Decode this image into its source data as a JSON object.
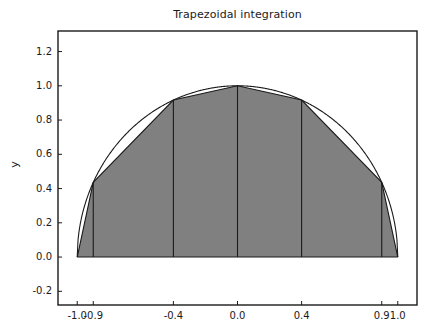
{
  "chart_data": {
    "type": "area",
    "title": "Trapezoidal integration",
    "xlabel": "",
    "ylabel": "y",
    "xlim": [
      -1.12,
      1.12
    ],
    "ylim": [
      -0.28,
      1.32
    ],
    "grid": false,
    "legend": null,
    "xticks": [
      -1.0,
      -0.9,
      -0.4,
      0.0,
      0.4,
      0.9,
      1.0
    ],
    "xtick_labels": [
      "-1.0",
      "-0.9",
      "-0.4",
      "0.0",
      "0.4",
      "0.9",
      "1.0"
    ],
    "yticks": [
      -0.2,
      0.0,
      0.2,
      0.4,
      0.6,
      0.8,
      1.0,
      1.2
    ],
    "ytick_labels": [
      "-0.2",
      "0.0",
      "0.2",
      "0.4",
      "0.6",
      "0.8",
      "1.0",
      "1.2"
    ],
    "curve": {
      "name": "f(x) = sqrt(1 - x^2)",
      "description": "smooth semicircle curve drawn as thin black outline",
      "color": "#1a1a1a",
      "x": [
        -1.0,
        -0.95,
        -0.9,
        -0.8,
        -0.7,
        -0.6,
        -0.5,
        -0.4,
        -0.3,
        -0.2,
        -0.1,
        0.0,
        0.1,
        0.2,
        0.3,
        0.4,
        0.5,
        0.6,
        0.7,
        0.8,
        0.9,
        0.95,
        1.0
      ],
      "y": [
        0.0,
        0.312,
        0.436,
        0.6,
        0.714,
        0.8,
        0.866,
        0.917,
        0.954,
        0.98,
        0.995,
        1.0,
        0.995,
        0.98,
        0.954,
        0.917,
        0.866,
        0.8,
        0.714,
        0.6,
        0.436,
        0.312,
        0.0
      ]
    },
    "trapezoids": {
      "name": "Trapezoidal approximation",
      "fill_color": "#808080",
      "edge_color": "#1a1a1a",
      "nodes_x": [
        -1.0,
        -0.9,
        -0.4,
        0.0,
        0.4,
        0.9,
        1.0
      ],
      "nodes_y": [
        0.0,
        0.436,
        0.917,
        1.0,
        0.917,
        0.436,
        0.0
      ],
      "panel_count": 6
    }
  },
  "axes": {
    "spine_color": "#1a1a1a",
    "background": "#ffffff",
    "tick_color": "#1a1a1a"
  }
}
